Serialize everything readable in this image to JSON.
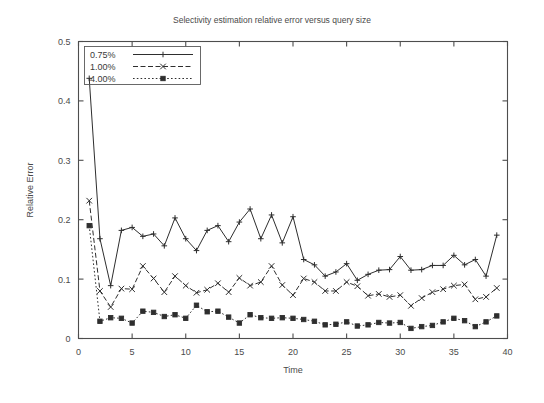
{
  "chart_data": {
    "type": "line",
    "title": "Selectivity estimation relative error versus query size",
    "xlabel": "Time",
    "ylabel": "Relative Error",
    "xlim": [
      0,
      40
    ],
    "ylim": [
      0,
      0.5
    ],
    "xticks": [
      0,
      5,
      10,
      15,
      20,
      25,
      30,
      35,
      40
    ],
    "xtick_labels": [
      "0",
      "5",
      "10",
      "15",
      "20",
      "25",
      "30",
      "35",
      "40"
    ],
    "yticks": [
      0,
      0.1,
      0.2,
      0.3,
      0.4,
      0.5
    ],
    "ytick_labels": [
      "0",
      "0.1",
      "0.2",
      "0.3",
      "0.4",
      "0.5"
    ],
    "grid": false,
    "legend_position": "top-left",
    "x": [
      1,
      2,
      3,
      4,
      5,
      6,
      7,
      8,
      9,
      10,
      11,
      12,
      13,
      14,
      15,
      16,
      17,
      18,
      19,
      20,
      21,
      22,
      23,
      24,
      25,
      26,
      27,
      28,
      29,
      30,
      31,
      32,
      33,
      34,
      35,
      36,
      37,
      38,
      39
    ],
    "series": [
      {
        "name": "0.75%",
        "marker": "plus",
        "linestyle": "solid",
        "color": "#2e2e2e",
        "values": [
          0.438,
          0.168,
          0.089,
          0.182,
          0.187,
          0.172,
          0.176,
          0.156,
          0.203,
          0.168,
          0.148,
          0.182,
          0.19,
          0.163,
          0.196,
          0.218,
          0.168,
          0.208,
          0.161,
          0.205,
          0.133,
          0.124,
          0.105,
          0.112,
          0.126,
          0.098,
          0.108,
          0.115,
          0.116,
          0.138,
          0.115,
          0.116,
          0.123,
          0.123,
          0.14,
          0.124,
          0.133,
          0.105,
          0.174
        ]
      },
      {
        "name": "1.00%",
        "marker": "cross",
        "linestyle": "dashed",
        "color": "#2e2e2e",
        "values": [
          0.232,
          0.08,
          0.053,
          0.084,
          0.083,
          0.122,
          0.101,
          0.078,
          0.105,
          0.089,
          0.077,
          0.082,
          0.093,
          0.078,
          0.102,
          0.089,
          0.095,
          0.122,
          0.09,
          0.073,
          0.101,
          0.095,
          0.08,
          0.08,
          0.095,
          0.088,
          0.072,
          0.075,
          0.07,
          0.073,
          0.055,
          0.068,
          0.078,
          0.083,
          0.089,
          0.091,
          0.066,
          0.07,
          0.085
        ]
      },
      {
        "name": "4.00%",
        "marker": "filled-square",
        "linestyle": "dotted",
        "color": "#2e2e2e",
        "values": [
          0.19,
          0.029,
          0.035,
          0.034,
          0.026,
          0.046,
          0.044,
          0.037,
          0.04,
          0.034,
          0.056,
          0.045,
          0.046,
          0.036,
          0.026,
          0.04,
          0.035,
          0.034,
          0.035,
          0.034,
          0.032,
          0.029,
          0.023,
          0.024,
          0.028,
          0.021,
          0.023,
          0.027,
          0.026,
          0.027,
          0.017,
          0.02,
          0.022,
          0.028,
          0.034,
          0.03,
          0.02,
          0.028,
          0.038
        ]
      }
    ]
  },
  "legend": {
    "entries": [
      {
        "label": "0.75%"
      },
      {
        "label": "1.00%"
      },
      {
        "label": "4.00%"
      }
    ]
  }
}
